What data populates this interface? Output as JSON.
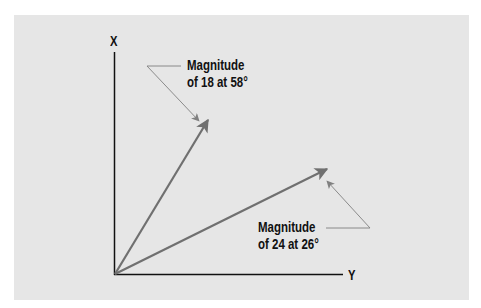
{
  "diagram": {
    "axes": {
      "vertical_label": "X",
      "horizontal_label": "Y"
    },
    "vectors": [
      {
        "magnitude": 18,
        "angle_deg": 58,
        "label_line1": "Magnitude",
        "label_line2": "of 18 at 58°"
      },
      {
        "magnitude": 24,
        "angle_deg": 26,
        "label_line1": "Magnitude",
        "label_line2": "of 24 at 26°"
      }
    ],
    "colors": {
      "background": "#e6e6e6",
      "axis": "#111111",
      "vector": "#707070",
      "callout_line": "#808080",
      "text": "#111111"
    }
  }
}
